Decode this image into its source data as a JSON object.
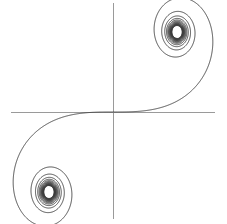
{
  "figure": {
    "background_color": "#ffffff",
    "width": 227,
    "height": 224
  },
  "axes": {
    "x_axis": {
      "label": "x-axis",
      "color": "#9a9a9a",
      "stroke_width": 1,
      "x1": 11,
      "y1": 112,
      "x2": 215,
      "y2": 112
    },
    "y_axis": {
      "label": "y-axis",
      "color": "#9a9a9a",
      "stroke_width": 1,
      "x1": 113,
      "y1": 3,
      "x2": 113,
      "y2": 219
    },
    "origin": {
      "x": 113,
      "y": 112
    }
  },
  "curve": {
    "name": "cornu-spiral",
    "color": "#3a3a3a",
    "stroke_width": 0.9,
    "upper_right_center": {
      "x": 177,
      "y": 32
    },
    "lower_left_center": {
      "x": 51,
      "y": 181
    }
  },
  "chart_data": {
    "type": "line",
    "subtitle": "Euler spiral / clothoid — parametric Fresnel integrals",
    "xlabel": "",
    "ylabel": "",
    "grid": false,
    "legend": false,
    "legend_position": "none",
    "parametric": true,
    "parameter": "t",
    "parameter_range": [
      -8,
      8
    ],
    "x_expression": "C(t) = integral_0^t cos(pi*u^2/2) du",
    "y_expression": "S(t) = integral_0^t sin(pi*u^2/2) du",
    "xlim": [
      -0.8,
      0.8
    ],
    "ylim": [
      -0.85,
      0.85
    ],
    "asymptotic_points": [
      {
        "label": "upper-right limit",
        "x": 0.5,
        "y": 0.5
      },
      {
        "label": "lower-left limit",
        "x": -0.5,
        "y": -0.5
      }
    ],
    "symmetry": "point symmetric about origin (odd function)",
    "series": [
      {
        "name": "Cornu spiral",
        "color": "#3a3a3a",
        "t": [
          -8.0,
          -7.6,
          -7.2,
          -6.8,
          -6.4,
          -6.0,
          -5.6,
          -5.2,
          -4.8,
          -4.4,
          -4.0,
          -3.6,
          -3.2,
          -2.8,
          -2.4,
          -2.0,
          -1.6,
          -1.2,
          -0.8,
          -0.4,
          0.0,
          0.4,
          0.8,
          1.2,
          1.6,
          2.0,
          2.4,
          2.8,
          3.2,
          3.6,
          4.0,
          4.4,
          4.8,
          5.2,
          5.6,
          6.0,
          6.4,
          6.8,
          7.2,
          7.6,
          8.0
        ],
        "x": [
          -0.4998,
          -0.5209,
          -0.4622,
          -0.5359,
          -0.4969,
          -0.4995,
          -0.4517,
          -0.5292,
          -0.4338,
          -0.5406,
          -0.4984,
          -0.4923,
          -0.4663,
          -0.4674,
          -0.555,
          -0.4883,
          -0.3655,
          -0.7154,
          -0.723,
          -0.397,
          0.0,
          0.397,
          0.723,
          0.7154,
          0.3655,
          0.4883,
          0.555,
          0.4674,
          0.4663,
          0.4923,
          0.4984,
          0.5406,
          0.4338,
          0.5292,
          0.4517,
          0.4995,
          0.4969,
          0.5359,
          0.4622,
          0.5209,
          0.4998
        ],
        "y": [
          -0.4602,
          -0.5194,
          -0.5366,
          -0.449,
          -0.5462,
          -0.447,
          -0.5161,
          -0.5465,
          -0.4342,
          -0.4296,
          -0.5204,
          -0.5924,
          -0.4631,
          -0.3915,
          -0.6196,
          -0.3434,
          -0.6388,
          -0.6234,
          -0.2493,
          -0.0334,
          0.0,
          0.0334,
          0.2493,
          0.6234,
          0.6388,
          0.3434,
          0.6196,
          0.3915,
          0.4631,
          0.5924,
          0.5204,
          0.4296,
          0.4342,
          0.5465,
          0.5161,
          0.447,
          0.5462,
          0.449,
          0.5366,
          0.5194,
          0.4602
        ]
      }
    ],
    "annotations": []
  }
}
